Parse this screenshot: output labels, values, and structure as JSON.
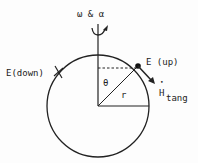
{
  "diagram": {
    "labels": {
      "omega_alpha": "ω & α",
      "e_up": "E (up)",
      "e_down": "E(down)",
      "theta": "θ",
      "r": "r",
      "h_symbol": "H",
      "h_dot": "•",
      "h_sub": "tang"
    },
    "colors": {
      "ink": "#222222",
      "background": "#fdfdfd"
    }
  }
}
